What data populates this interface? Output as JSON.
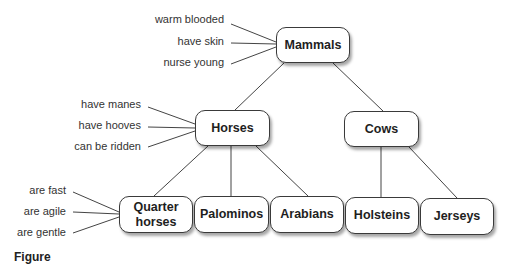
{
  "diagram": {
    "type": "hierarchy",
    "nodes": {
      "mammals": "Mammals",
      "horses": "Horses",
      "cows": "Cows",
      "quarter_horses": "Quarter horses",
      "palominos": "Palominos",
      "arabians": "Arabians",
      "holsteins": "Holsteins",
      "jerseys": "Jerseys"
    },
    "edges": [
      [
        "Mammals",
        "Horses"
      ],
      [
        "Mammals",
        "Cows"
      ],
      [
        "Horses",
        "Quarter horses"
      ],
      [
        "Horses",
        "Palominos"
      ],
      [
        "Horses",
        "Arabians"
      ],
      [
        "Cows",
        "Holsteins"
      ],
      [
        "Cows",
        "Jerseys"
      ]
    ],
    "attributes": {
      "mammals": [
        "warm blooded",
        "have skin",
        "nurse young"
      ],
      "horses": [
        "have manes",
        "have hooves",
        "can be ridden"
      ],
      "quarter_horses": [
        "are fast",
        "are agile",
        "are gentle"
      ]
    },
    "caption": "Figure"
  }
}
